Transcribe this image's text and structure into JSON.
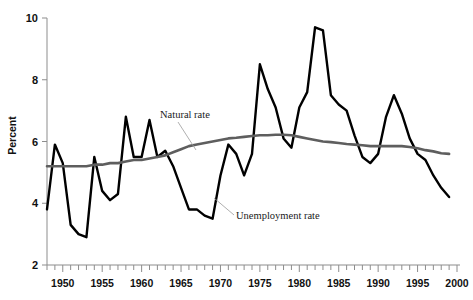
{
  "chart_data": {
    "type": "line",
    "title": "",
    "xlabel": "",
    "ylabel": "Percent",
    "xlim": [
      1948,
      2000
    ],
    "ylim": [
      2,
      10
    ],
    "grid": false,
    "legend_position": "inline-annotations",
    "x_ticks_major": [
      1950,
      1955,
      1960,
      1965,
      1970,
      1975,
      1980,
      1985,
      1990,
      1995,
      2000
    ],
    "x_tick_labels": [
      "1950",
      "1955",
      "1960",
      "1965",
      "1970",
      "1975",
      "1980",
      "1985",
      "1990",
      "1995",
      "2000"
    ],
    "x_tick_minor_step": 1,
    "y_ticks": [
      2,
      4,
      6,
      8,
      10
    ],
    "y_tick_labels": [
      "2",
      "4",
      "6",
      "8",
      "10"
    ],
    "x": [
      1948,
      1949,
      1950,
      1951,
      1952,
      1953,
      1954,
      1955,
      1956,
      1957,
      1958,
      1959,
      1960,
      1961,
      1962,
      1963,
      1964,
      1965,
      1966,
      1967,
      1968,
      1969,
      1970,
      1971,
      1972,
      1973,
      1974,
      1975,
      1976,
      1977,
      1978,
      1979,
      1980,
      1981,
      1982,
      1983,
      1984,
      1985,
      1986,
      1987,
      1988,
      1989,
      1990,
      1991,
      1992,
      1993,
      1994,
      1995,
      1996,
      1997,
      1998,
      1999
    ],
    "series": [
      {
        "name": "Unemployment rate",
        "color": "#000000",
        "values": [
          3.8,
          5.9,
          5.3,
          3.3,
          3.0,
          2.9,
          5.5,
          4.4,
          4.1,
          4.3,
          6.8,
          5.5,
          5.5,
          6.7,
          5.5,
          5.7,
          5.2,
          4.5,
          3.8,
          3.8,
          3.6,
          3.5,
          4.9,
          5.9,
          5.6,
          4.9,
          5.6,
          8.5,
          7.7,
          7.1,
          6.1,
          5.8,
          7.1,
          7.6,
          9.7,
          9.6,
          7.5,
          7.2,
          7.0,
          6.2,
          5.5,
          5.3,
          5.6,
          6.8,
          7.5,
          6.9,
          6.1,
          5.6,
          5.4,
          4.9,
          4.5,
          4.2
        ]
      },
      {
        "name": "Natural rate",
        "color": "#5e5e5e",
        "values": [
          5.2,
          5.2,
          5.2,
          5.2,
          5.2,
          5.2,
          5.25,
          5.25,
          5.3,
          5.3,
          5.35,
          5.4,
          5.4,
          5.45,
          5.5,
          5.55,
          5.65,
          5.75,
          5.85,
          5.9,
          5.95,
          6.0,
          6.05,
          6.1,
          6.12,
          6.15,
          6.18,
          6.2,
          6.2,
          6.22,
          6.22,
          6.2,
          6.15,
          6.1,
          6.05,
          6.0,
          5.98,
          5.95,
          5.92,
          5.9,
          5.88,
          5.85,
          5.85,
          5.85,
          5.85,
          5.85,
          5.82,
          5.78,
          5.72,
          5.68,
          5.62,
          5.6
        ]
      }
    ],
    "annotations": [
      {
        "name": "natural-rate-label",
        "text": "Natural rate",
        "text_x": 160,
        "text_y": 118,
        "leader": "M 178 122 L 196 150"
      },
      {
        "name": "unemployment-rate-label",
        "text": "Unemployment rate",
        "text_x": 236,
        "text_y": 219,
        "leader": "M 234 215 L 214 198"
      }
    ]
  },
  "layout": {
    "plot_left": 47,
    "plot_right": 457,
    "plot_top": 18,
    "plot_bottom": 265
  }
}
